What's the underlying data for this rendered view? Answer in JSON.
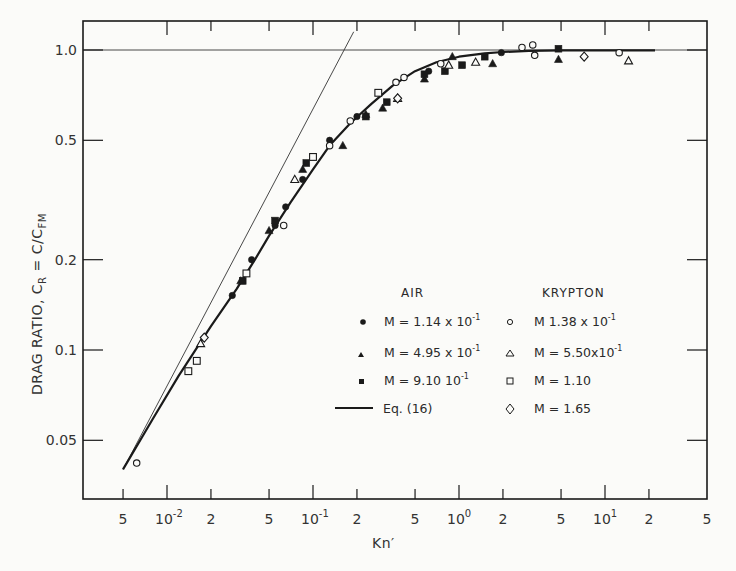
{
  "chart_data": {
    "type": "scatter",
    "title": "",
    "xlabel": "Kn'",
    "ylabel": "DRAG RATIO, C_R = C/C_FM",
    "xscale": "log",
    "yscale": "log",
    "xlim": [
      0.005,
      50
    ],
    "ylim": [
      0.04,
      1.15
    ],
    "grid": false,
    "x_ticks": [
      {
        "value": 0.005,
        "label": "5"
      },
      {
        "value": 0.01,
        "label": "10",
        "sup": "-2"
      },
      {
        "value": 0.02,
        "label": "2"
      },
      {
        "value": 0.05,
        "label": "5"
      },
      {
        "value": 0.1,
        "label": "10",
        "sup": "-1"
      },
      {
        "value": 0.2,
        "label": "2"
      },
      {
        "value": 0.5,
        "label": "5"
      },
      {
        "value": 1,
        "label": "10",
        "sup": "0"
      },
      {
        "value": 2,
        "label": "2"
      },
      {
        "value": 5,
        "label": "5"
      },
      {
        "value": 10,
        "label": "10",
        "sup": "1"
      },
      {
        "value": 20,
        "label": "2"
      },
      {
        "value": 50,
        "label": "5"
      }
    ],
    "y_ticks": [
      {
        "value": 1.0,
        "label": "1.0"
      },
      {
        "value": 0.5,
        "label": "0.5"
      },
      {
        "value": 0.2,
        "label": "0.2"
      },
      {
        "value": 0.1,
        "label": "0.1"
      },
      {
        "value": 0.05,
        "label": "0.05"
      }
    ],
    "reference_lines": [
      {
        "name": "C_R = 1 (free molecule limit)",
        "type": "horizontal",
        "y": 1.0
      },
      {
        "name": "continuum asymptote",
        "type": "line",
        "points": [
          [
            0.005,
            0.04
          ],
          [
            0.19,
            1.15
          ]
        ]
      }
    ],
    "legend": {
      "position": "center-right",
      "groups": [
        {
          "heading": "AIR",
          "entries": [
            {
              "marker": "filled-circle",
              "label": "M = 1.14 x 10",
              "sup": "-1"
            },
            {
              "marker": "filled-triangle",
              "label": "M = 4.95 x 10",
              "sup": "-1"
            },
            {
              "marker": "filled-square",
              "label": "M = 9.10   10",
              "sup": "-1"
            },
            {
              "marker": "line",
              "label": "Eq. (16)"
            }
          ]
        },
        {
          "heading": "KRYPTON",
          "entries": [
            {
              "marker": "open-circle",
              "label": "M   1.38 x 10",
              "sup": "-1"
            },
            {
              "marker": "open-triangle",
              "label": "M = 5.50x10",
              "sup": "-1"
            },
            {
              "marker": "open-square",
              "label": "M = 1.10"
            },
            {
              "marker": "open-diamond",
              "label": "M = 1.65"
            }
          ]
        }
      ]
    },
    "series": [
      {
        "name": "Eq. (16)",
        "type": "line",
        "x": [
          0.005,
          0.008,
          0.012,
          0.02,
          0.03,
          0.04,
          0.05,
          0.07,
          0.1,
          0.13,
          0.18,
          0.25,
          0.35,
          0.5,
          0.7,
          1.0,
          1.5,
          2.0,
          3.0,
          5.0,
          10,
          22
        ],
        "y": [
          0.04,
          0.059,
          0.082,
          0.12,
          0.16,
          0.2,
          0.24,
          0.31,
          0.4,
          0.48,
          0.57,
          0.66,
          0.76,
          0.85,
          0.91,
          0.95,
          0.975,
          0.985,
          0.993,
          0.997,
          0.998,
          0.998
        ]
      },
      {
        "name": "Air M=1.14x10^-1",
        "marker": "filled-circle",
        "x": [
          0.028,
          0.038,
          0.055,
          0.065,
          0.085,
          0.13,
          0.2,
          0.62,
          1.95
        ],
        "y": [
          0.152,
          0.2,
          0.26,
          0.3,
          0.37,
          0.5,
          0.6,
          0.85,
          0.98
        ]
      },
      {
        "name": "Air M=4.95x10^-1",
        "marker": "filled-triangle",
        "x": [
          0.032,
          0.05,
          0.085,
          0.16,
          0.23,
          0.3,
          0.58,
          0.9,
          1.7,
          4.8
        ],
        "y": [
          0.17,
          0.25,
          0.4,
          0.48,
          0.61,
          0.64,
          0.8,
          0.95,
          0.9,
          0.93
        ]
      },
      {
        "name": "Air M=9.10x10^-1",
        "marker": "filled-square",
        "x": [
          0.033,
          0.055,
          0.09,
          0.23,
          0.32,
          0.58,
          0.8,
          1.05,
          1.5,
          4.8
        ],
        "y": [
          0.17,
          0.27,
          0.42,
          0.6,
          0.67,
          0.83,
          0.85,
          0.89,
          0.95,
          1.01
        ]
      },
      {
        "name": "Krypton M=1.38x10^-1",
        "marker": "open-circle",
        "x": [
          0.0062,
          0.063,
          0.13,
          0.18,
          0.37,
          0.42,
          0.75,
          2.7,
          3.2,
          3.3,
          12.5
        ],
        "y": [
          0.042,
          0.26,
          0.48,
          0.58,
          0.78,
          0.81,
          0.9,
          1.02,
          1.04,
          0.96,
          0.98
        ]
      },
      {
        "name": "Krypton M=5.50x10^-1",
        "marker": "open-triangle",
        "x": [
          0.017,
          0.075,
          0.38,
          0.85,
          1.3,
          14.5
        ],
        "y": [
          0.105,
          0.37,
          0.69,
          0.89,
          0.91,
          0.92
        ]
      },
      {
        "name": "Krypton M=1.10",
        "marker": "open-square",
        "x": [
          0.014,
          0.016,
          0.035,
          0.1,
          0.28
        ],
        "y": [
          0.085,
          0.092,
          0.18,
          0.44,
          0.72
        ]
      },
      {
        "name": "Krypton M=1.65",
        "marker": "open-diamond",
        "x": [
          0.018,
          0.38,
          7.2
        ],
        "y": [
          0.11,
          0.69,
          0.95
        ]
      }
    ]
  },
  "axes": {
    "ylabel_main": "DRAG RATIO,  C",
    "ylabel_sub_r": "R",
    "ylabel_eq": " = ",
    "ylabel_c": "C/C",
    "ylabel_sub_fm": "FM",
    "xlabel": "Kn′"
  },
  "legend": {
    "air_heading": "AIR",
    "krypton_heading": "KRYPTON",
    "air": [
      "M = 1.14 x 10",
      "M = 4.95 x 10",
      "M = 9.10   10",
      "Eq. (16)"
    ],
    "air_sup": [
      "-1",
      "-1",
      "-1",
      ""
    ],
    "krypton": [
      "M   1.38 x 10",
      "M = 5.50x10",
      "M = 1.10",
      "M = 1.65"
    ],
    "krypton_sup": [
      "-1",
      "-1",
      "",
      ""
    ]
  },
  "colors": {
    "ink": "#1a1a1a",
    "paper": "#fbfbf9",
    "thin_line": "#333333"
  }
}
